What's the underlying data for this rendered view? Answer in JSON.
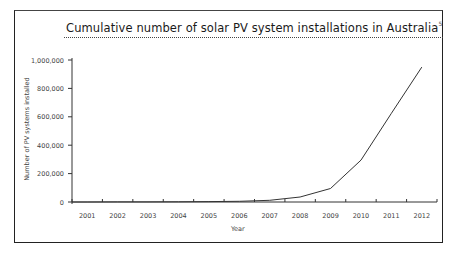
{
  "chart_data": {
    "type": "line",
    "title": "Cumulative number of solar PV system installations in Australia",
    "title_footnote": "5",
    "xlabel": "Year",
    "ylabel": "Number of PV systems installed",
    "categories": [
      "2001",
      "2002",
      "2003",
      "2004",
      "2005",
      "2006",
      "2007",
      "2008",
      "2009",
      "2010",
      "2011",
      "2012"
    ],
    "series": [
      {
        "name": "Cumulative PV installations",
        "values": [
          0,
          500,
          1000,
          1500,
          2500,
          5000,
          12000,
          35000,
          95000,
          295000,
          625000,
          950000
        ]
      }
    ],
    "yticks": [
      "0",
      "200,000",
      "400,000",
      "600,000",
      "800,000",
      "1,000,000"
    ],
    "ylim": [
      0,
      1000000
    ],
    "grid": false,
    "legend": "none",
    "line_color": "#333333"
  }
}
